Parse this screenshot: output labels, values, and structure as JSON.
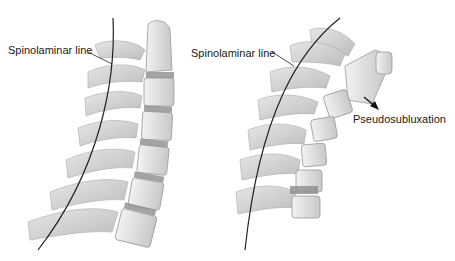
{
  "figure": {
    "panels": [
      {
        "id": "normal",
        "label": "Spinolaminar line"
      },
      {
        "id": "pseudosubluxation",
        "label": "Spinolaminar line",
        "annotation": "Pseudosubluxation"
      }
    ],
    "colors": {
      "bone": "#d9d9d9",
      "bone_edge": "#a8a8a8",
      "disc": "#8c8c8c",
      "line": "#222222",
      "text": "#1a1a1a"
    }
  }
}
